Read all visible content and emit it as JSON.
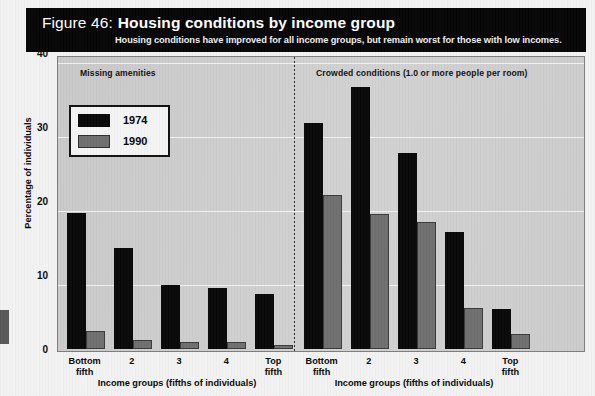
{
  "banner": {
    "figure_number": "Figure 46:",
    "title": "Housing conditions by income group",
    "subtitle": "Housing conditions have improved for all income groups, but remain worst for those with low incomes."
  },
  "legend": {
    "items": [
      {
        "label": "1974",
        "color": "#080808"
      },
      {
        "label": "1990",
        "color": "#6f6f6f"
      }
    ]
  },
  "panels": [
    {
      "title": "Missing amenities",
      "xaxis_label": "Income groups (fifths of individuals)"
    },
    {
      "title": "Crowded conditions (1.0 or more people per room)",
      "xaxis_label": "Income groups (fifths of individuals)"
    }
  ],
  "yaxis": {
    "label": "Percentage of individuals",
    "ticks": [
      "0",
      "10",
      "20",
      "30",
      "40"
    ]
  },
  "xaxis": {
    "categories_line1": [
      "Bottom",
      "2",
      "3",
      "4",
      "Top"
    ],
    "categories_line2": [
      "fifth",
      "",
      "",
      "",
      "fifth"
    ]
  },
  "chart_data": {
    "type": "bar",
    "title": "Housing conditions by income group",
    "subtitle": "Housing conditions have improved for all income groups, but remain worst for those with low incomes.",
    "xlabel": "Income groups (fifths of individuals)",
    "ylabel": "Percentage of individuals",
    "ylim": [
      0,
      40
    ],
    "yticks": [
      0,
      10,
      20,
      30,
      40
    ],
    "grid": true,
    "legend_position": "upper-left",
    "categories": [
      "Bottom fifth",
      "2",
      "3",
      "4",
      "Top fifth"
    ],
    "panels": [
      {
        "name": "Missing amenities",
        "series": [
          {
            "name": "1974",
            "color": "#080808",
            "values": [
              18.4,
              13.6,
              8.7,
              8.2,
              7.4
            ]
          },
          {
            "name": "1990",
            "color": "#6f6f6f",
            "values": [
              2.4,
              1.2,
              1.0,
              1.0,
              0.6
            ]
          }
        ]
      },
      {
        "name": "Crowded conditions (1.0 or more people per room)",
        "series": [
          {
            "name": "1974",
            "color": "#080808",
            "values": [
              30.6,
              35.4,
              26.5,
              15.8,
              5.4
            ]
          },
          {
            "name": "1990",
            "color": "#6f6f6f",
            "values": [
              20.8,
              18.2,
              17.2,
              5.5,
              2.0
            ]
          }
        ]
      }
    ]
  }
}
